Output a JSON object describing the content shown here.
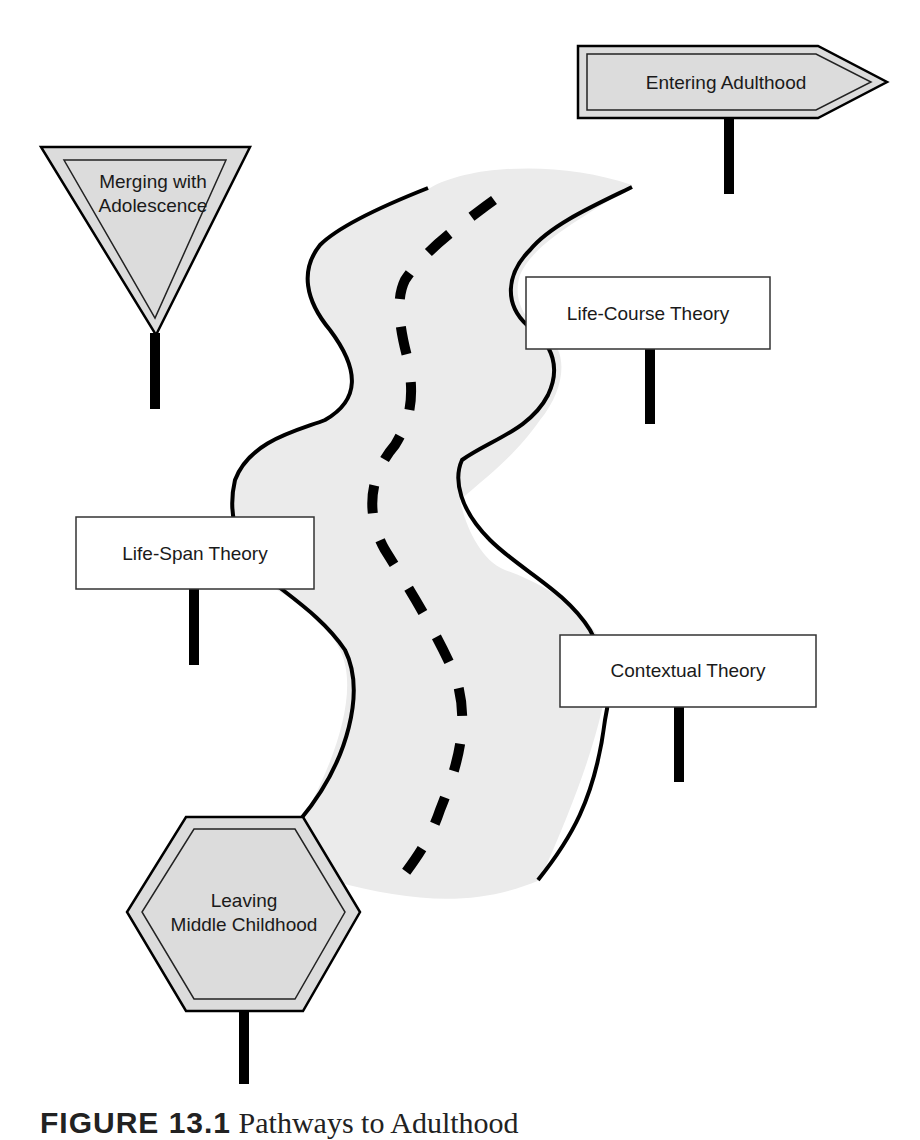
{
  "diagram": {
    "type": "road-map metaphor",
    "colors": {
      "road_fill": "#ebebeb",
      "road_edge": "#000000",
      "sign_fill_shaded": "#dcdcdc",
      "sign_fill_plain": "#ffffff",
      "post": "#000000"
    },
    "signs": {
      "entering": {
        "label": "Entering Adulthood",
        "shape": "arrow-right"
      },
      "merging": {
        "line1": "Merging with",
        "line2": "Adolescence",
        "shape": "inverted-triangle"
      },
      "life_course": {
        "label": "Life-Course Theory",
        "shape": "rectangle"
      },
      "life_span": {
        "label": "Life-Span Theory",
        "shape": "rectangle"
      },
      "contextual": {
        "label": "Contextual Theory",
        "shape": "rectangle"
      },
      "leaving": {
        "line1": "Leaving",
        "line2": "Middle Childhood",
        "shape": "hexagon"
      }
    },
    "caption": {
      "figure": "FIGURE 13.1",
      "text": "Pathways to Adulthood"
    }
  }
}
